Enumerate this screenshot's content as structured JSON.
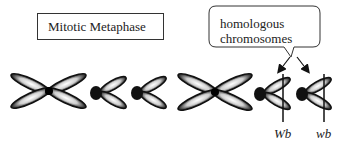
{
  "title": "Mitotic Metaphase",
  "callout": {
    "line1": "homologous",
    "line2": "chromosomes"
  },
  "labels": {
    "left_homolog": "Wb",
    "right_homolog": "wb"
  },
  "colors": {
    "outline": "#111111",
    "chromatid_fill": "#e8e8e8",
    "centromere": "#000000",
    "text": "#222222"
  }
}
